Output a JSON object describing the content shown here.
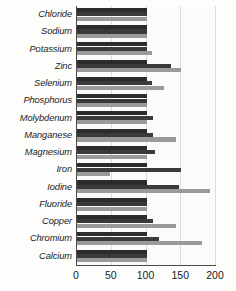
{
  "chart_data": {
    "type": "bar",
    "orientation": "horizontal",
    "title": "",
    "subtitle": "",
    "xlabel": "",
    "ylabel": "",
    "xlim": [
      0,
      200
    ],
    "xticks": [
      0,
      50,
      100,
      150,
      200
    ],
    "xtick_labels": [
      "0",
      "50",
      "100",
      "150",
      "200"
    ],
    "grid": true,
    "grid_axis": "x",
    "legend": false,
    "legend_position": "none",
    "categories": [
      "Chloride",
      "Sodium",
      "Potassium",
      "Zinc",
      "Selenium",
      "Phosphorus",
      "Molybdenum",
      "Manganese",
      "Magnesium",
      "Iron",
      "Iodine",
      "Fluoride",
      "Copper",
      "Chromium",
      "Calcium"
    ],
    "series": [
      {
        "name": "Series 1",
        "color": "#2c2c2c",
        "values": [
          100,
          100,
          100,
          100,
          100,
          100,
          100,
          100,
          100,
          100,
          100,
          100,
          100,
          100,
          100
        ]
      },
      {
        "name": "Series 2",
        "color": "#3a3a3a",
        "values": [
          100,
          100,
          100,
          135,
          108,
          100,
          110,
          110,
          112,
          150,
          147,
          100,
          110,
          118,
          100
        ]
      },
      {
        "name": "Series 3",
        "color": "#9a9a9a",
        "values": [
          100,
          100,
          108,
          150,
          125,
          100,
          100,
          142,
          100,
          48,
          192,
          100,
          142,
          180,
          100
        ]
      }
    ]
  },
  "colors": {
    "series_1": "#2c2c2c",
    "series_2": "#3a3a3a",
    "series_3": "#9a9a9a",
    "axis": "#4a4a4a",
    "gridline": "#dcdcdc",
    "background": "#fdfdfc",
    "text": "#1c1c1c"
  }
}
